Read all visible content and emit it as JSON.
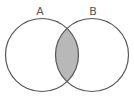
{
  "diagram": {
    "type": "venn",
    "sets": [
      {
        "label": "A",
        "cx": 42,
        "cy": 55,
        "r": 36.5
      },
      {
        "label": "B",
        "cx": 92,
        "cy": 55,
        "r": 36.5
      }
    ],
    "shaded_region": "A ∩ B",
    "colors": {
      "stroke": "#555555",
      "fill_intersection": "#b8b8b8",
      "background": "#ffffff"
    }
  }
}
